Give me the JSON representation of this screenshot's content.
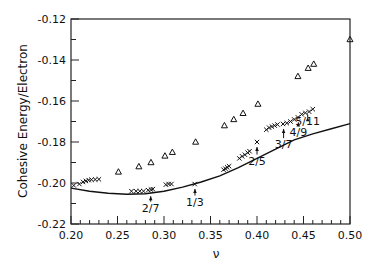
{
  "chart_data": {
    "type": "scatter",
    "title": "",
    "xlabel": "ν",
    "ylabel": "Cohesive Energy/Electron",
    "xlim": [
      0.2,
      0.5
    ],
    "ylim": [
      -0.22,
      -0.12
    ],
    "xticks": [
      "0.20",
      "0.25",
      "0.30",
      "0.35",
      "0.40",
      "0.45",
      "0.50"
    ],
    "yticks": [
      "-0.12",
      "-0.14",
      "-0.16",
      "-0.18",
      "-0.20",
      "-0.22"
    ],
    "x_minor_step": 0.01,
    "y_minor_step": 0.01,
    "grid": false,
    "legend": null,
    "values_are_estimates": true,
    "estimation_note": "No data labels in source image; every point value is read from pixel position against axis ticks. Approximate precision ±0.002 on both axes.",
    "series": [
      {
        "name": "triangles",
        "marker": "triangle-open",
        "points": [
          [
            0.251,
            -0.1946
          ],
          [
            0.273,
            -0.192
          ],
          [
            0.286,
            -0.19
          ],
          [
            0.301,
            -0.1868
          ],
          [
            0.309,
            -0.185
          ],
          [
            0.334,
            -0.18
          ],
          [
            0.365,
            -0.172
          ],
          [
            0.375,
            -0.169
          ],
          [
            0.385,
            -0.166
          ],
          [
            0.401,
            -0.1615
          ],
          [
            0.444,
            -0.148
          ],
          [
            0.455,
            -0.144
          ],
          [
            0.461,
            -0.142
          ],
          [
            0.5,
            -0.13
          ]
        ]
      },
      {
        "name": "crosses",
        "marker": "x",
        "points": [
          [
            0.203,
            -0.2012
          ],
          [
            0.209,
            -0.2005
          ],
          [
            0.213,
            -0.1995
          ],
          [
            0.216,
            -0.199
          ],
          [
            0.219,
            -0.1986
          ],
          [
            0.222,
            -0.1984
          ],
          [
            0.226,
            -0.1983
          ],
          [
            0.23,
            -0.1982
          ],
          [
            0.265,
            -0.204
          ],
          [
            0.27,
            -0.204
          ],
          [
            0.274,
            -0.204
          ],
          [
            0.278,
            -0.204
          ],
          [
            0.283,
            -0.2035
          ],
          [
            0.286,
            -0.2032
          ],
          [
            0.288,
            -0.203
          ],
          [
            0.302,
            -0.2008
          ],
          [
            0.305,
            -0.2005
          ],
          [
            0.308,
            -0.2005
          ],
          [
            0.333,
            -0.2005
          ],
          [
            0.364,
            -0.1935
          ],
          [
            0.366,
            -0.193
          ],
          [
            0.368,
            -0.1924
          ],
          [
            0.37,
            -0.1918
          ],
          [
            0.381,
            -0.188
          ],
          [
            0.384,
            -0.187
          ],
          [
            0.387,
            -0.1862
          ],
          [
            0.39,
            -0.1852
          ],
          [
            0.392,
            -0.1845
          ],
          [
            0.4,
            -0.18
          ],
          [
            0.41,
            -0.174
          ],
          [
            0.413,
            -0.173
          ],
          [
            0.416,
            -0.1725
          ],
          [
            0.419,
            -0.172
          ],
          [
            0.422,
            -0.1715
          ],
          [
            0.428,
            -0.1712
          ],
          [
            0.432,
            -0.1708
          ],
          [
            0.436,
            -0.17
          ],
          [
            0.44,
            -0.169
          ],
          [
            0.444,
            -0.168
          ],
          [
            0.448,
            -0.1665
          ],
          [
            0.452,
            -0.1658
          ],
          [
            0.456,
            -0.1652
          ],
          [
            0.46,
            -0.164
          ]
        ]
      },
      {
        "name": "curve",
        "marker": "line",
        "points": [
          [
            0.2,
            -0.2025
          ],
          [
            0.22,
            -0.204
          ],
          [
            0.24,
            -0.205
          ],
          [
            0.26,
            -0.2055
          ],
          [
            0.28,
            -0.2052
          ],
          [
            0.3,
            -0.204
          ],
          [
            0.32,
            -0.202
          ],
          [
            0.34,
            -0.1995
          ],
          [
            0.36,
            -0.1965
          ],
          [
            0.38,
            -0.1925
          ],
          [
            0.4,
            -0.188
          ],
          [
            0.42,
            -0.1835
          ],
          [
            0.44,
            -0.179
          ],
          [
            0.46,
            -0.176
          ],
          [
            0.48,
            -0.1735
          ],
          [
            0.5,
            -0.171
          ]
        ]
      }
    ],
    "annotations": [
      {
        "label": "2/7",
        "x": 0.2857,
        "arrow_to": -0.204,
        "text_y": -0.214
      },
      {
        "label": "1/3",
        "x": 0.3333,
        "arrow_to": -0.2005,
        "text_y": -0.211
      },
      {
        "label": "2/5",
        "x": 0.4,
        "arrow_to": -0.18,
        "text_y": -0.191
      },
      {
        "label": "3/7",
        "x": 0.4286,
        "arrow_to": -0.1712,
        "text_y": -0.183
      },
      {
        "label": "4/9",
        "x": 0.4444,
        "arrow_to": -0.168,
        "text_y": -0.177
      },
      {
        "label": "5/11",
        "x": 0.4545,
        "arrow_to": -0.1655,
        "text_y": -0.1715
      }
    ]
  }
}
